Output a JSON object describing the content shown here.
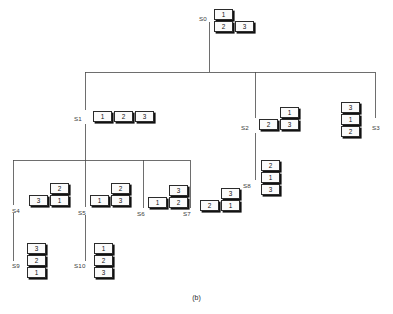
{
  "figure": {
    "caption": "(b)",
    "caption_x": 0,
    "caption_y": 294,
    "width": 393,
    "height": 314,
    "background": "#ffffff",
    "line_color": "#4a4a4a",
    "cell_border_color": "#2b2b2b",
    "cell_fill": "#fbfbfb",
    "shadow_color": "#111111"
  },
  "nodes": [
    {
      "id": "S0",
      "label": "S0",
      "label_x": 199,
      "label_y": 16,
      "shape_x": 214,
      "shape_y": 9,
      "cells": [
        {
          "value": "1",
          "x": 0,
          "y": 0
        },
        {
          "value": "2",
          "x": 0,
          "y": 12
        },
        {
          "value": "3",
          "x": 21,
          "y": 12
        }
      ]
    },
    {
      "id": "S1",
      "label": "S1",
      "label_x": 74,
      "label_y": 116,
      "shape_x": 93,
      "shape_y": 111,
      "cells": [
        {
          "value": "1",
          "x": 0,
          "y": 0
        },
        {
          "value": "2",
          "x": 21,
          "y": 0
        },
        {
          "value": "3",
          "x": 42,
          "y": 0
        }
      ]
    },
    {
      "id": "S2",
      "label": "S2",
      "label_x": 241,
      "label_y": 125,
      "shape_x": 259,
      "shape_y": 107,
      "cells": [
        {
          "value": "1",
          "x": 21,
          "y": 0
        },
        {
          "value": "2",
          "x": 0,
          "y": 12
        },
        {
          "value": "3",
          "x": 21,
          "y": 12
        }
      ]
    },
    {
      "id": "S3",
      "label": "S3",
      "label_x": 372,
      "label_y": 125,
      "shape_x": 341,
      "shape_y": 102,
      "cells": [
        {
          "value": "3",
          "x": 0,
          "y": 0
        },
        {
          "value": "1",
          "x": 0,
          "y": 12
        },
        {
          "value": "2",
          "x": 0,
          "y": 24
        }
      ]
    },
    {
      "id": "S4",
      "label": "S4",
      "label_x": 12,
      "label_y": 208,
      "shape_x": 29,
      "shape_y": 183,
      "cells": [
        {
          "value": "2",
          "x": 21,
          "y": 0
        },
        {
          "value": "3",
          "x": 0,
          "y": 12
        },
        {
          "value": "1",
          "x": 21,
          "y": 12
        }
      ]
    },
    {
      "id": "S5",
      "label": "S5",
      "label_x": 78,
      "label_y": 210,
      "shape_x": 90,
      "shape_y": 183,
      "cells": [
        {
          "value": "2",
          "x": 21,
          "y": 0
        },
        {
          "value": "1",
          "x": 0,
          "y": 12
        },
        {
          "value": "3",
          "x": 21,
          "y": 12
        }
      ]
    },
    {
      "id": "S6",
      "label": "S6",
      "label_x": 137,
      "label_y": 211,
      "shape_x": 148,
      "shape_y": 185,
      "cells": [
        {
          "value": "3",
          "x": 21,
          "y": 0
        },
        {
          "value": "1",
          "x": 0,
          "y": 12
        },
        {
          "value": "2",
          "x": 21,
          "y": 12
        }
      ]
    },
    {
      "id": "S7",
      "label": "S7",
      "label_x": 183,
      "label_y": 211,
      "shape_x": 200,
      "shape_y": 188,
      "cells": [
        {
          "value": "3",
          "x": 21,
          "y": 0
        },
        {
          "value": "2",
          "x": 0,
          "y": 12
        },
        {
          "value": "1",
          "x": 21,
          "y": 12
        }
      ]
    },
    {
      "id": "S8",
      "label": "S8",
      "label_x": 243,
      "label_y": 183,
      "shape_x": 261,
      "shape_y": 160,
      "cells": [
        {
          "value": "2",
          "x": 0,
          "y": 0
        },
        {
          "value": "1",
          "x": 0,
          "y": 12
        },
        {
          "value": "3",
          "x": 0,
          "y": 24
        }
      ]
    },
    {
      "id": "S9",
      "label": "S9",
      "label_x": 12,
      "label_y": 263,
      "shape_x": 27,
      "shape_y": 243,
      "cells": [
        {
          "value": "3",
          "x": 0,
          "y": 0
        },
        {
          "value": "2",
          "x": 0,
          "y": 12
        },
        {
          "value": "1",
          "x": 0,
          "y": 24
        }
      ]
    },
    {
      "id": "S10",
      "label": "S10",
      "label_x": 74,
      "label_y": 263,
      "shape_x": 94,
      "shape_y": 243,
      "cells": [
        {
          "value": "1",
          "x": 0,
          "y": 0
        },
        {
          "value": "2",
          "x": 0,
          "y": 12
        },
        {
          "value": "3",
          "x": 0,
          "y": 24
        }
      ]
    }
  ],
  "edges": [
    {
      "name": "s0-stem",
      "x1": 209,
      "y1": 22,
      "x2": 209,
      "y2": 72
    },
    {
      "name": "level1-bar",
      "x1": 85,
      "y1": 72,
      "x2": 375,
      "y2": 72
    },
    {
      "name": "s1-drop",
      "x1": 85,
      "y1": 72,
      "x2": 85,
      "y2": 110
    },
    {
      "name": "s2-drop",
      "x1": 255,
      "y1": 72,
      "x2": 255,
      "y2": 118
    },
    {
      "name": "s3-drop",
      "x1": 375,
      "y1": 72,
      "x2": 375,
      "y2": 118
    },
    {
      "name": "s1-stem",
      "x1": 85,
      "y1": 124,
      "x2": 85,
      "y2": 160
    },
    {
      "name": "level2-bar",
      "x1": 13,
      "y1": 160,
      "x2": 190,
      "y2": 160
    },
    {
      "name": "s4-drop",
      "x1": 13,
      "y1": 160,
      "x2": 13,
      "y2": 205
    },
    {
      "name": "s5-drop",
      "x1": 85,
      "y1": 160,
      "x2": 85,
      "y2": 207
    },
    {
      "name": "s6-drop",
      "x1": 143,
      "y1": 160,
      "x2": 143,
      "y2": 208
    },
    {
      "name": "s7-drop",
      "x1": 190,
      "y1": 160,
      "x2": 190,
      "y2": 208
    },
    {
      "name": "s2-to-s8",
      "x1": 255,
      "y1": 133,
      "x2": 255,
      "y2": 180
    },
    {
      "name": "s4-to-s9",
      "x1": 13,
      "y1": 213,
      "x2": 13,
      "y2": 261
    },
    {
      "name": "s5-to-s10",
      "x1": 85,
      "y1": 215,
      "x2": 85,
      "y2": 261
    }
  ]
}
